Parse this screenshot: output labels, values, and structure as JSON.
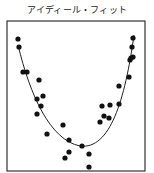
{
  "chart_data": {
    "type": "scatter",
    "title": "アイディール・フィット",
    "xlabel": "",
    "ylabel": "",
    "grid": false,
    "legend": null,
    "frame": {
      "x": 7,
      "y": 21,
      "width": 138,
      "height": 150
    },
    "colors": {
      "points": "#111111",
      "curve": "#222222",
      "frame": "#333333"
    },
    "series": [
      {
        "name": "data points",
        "kind": "scatter",
        "points": [
          [
            18,
            39
          ],
          [
            19,
            47
          ],
          [
            23,
            72
          ],
          [
            27,
            72
          ],
          [
            39,
            80
          ],
          [
            37,
            99
          ],
          [
            43,
            96
          ],
          [
            41,
            106
          ],
          [
            37,
            114
          ],
          [
            47,
            134
          ],
          [
            63,
            125
          ],
          [
            69,
            140
          ],
          [
            69,
            152
          ],
          [
            65,
            158
          ],
          [
            82,
            146
          ],
          [
            89,
            154
          ],
          [
            89,
            167
          ],
          [
            100,
            122
          ],
          [
            102,
            106
          ],
          [
            104,
            116
          ],
          [
            109,
            118
          ],
          [
            110,
            105
          ],
          [
            119,
            104
          ],
          [
            119,
            86
          ],
          [
            129,
            77
          ],
          [
            130,
            60
          ],
          [
            131,
            58
          ],
          [
            133,
            57
          ],
          [
            132,
            47
          ],
          [
            133,
            38
          ]
        ]
      },
      {
        "name": "fit curve",
        "kind": "line",
        "path": "M18,45 C30,95 50,140 80,146 C110,150 125,100 134,35"
      }
    ]
  }
}
